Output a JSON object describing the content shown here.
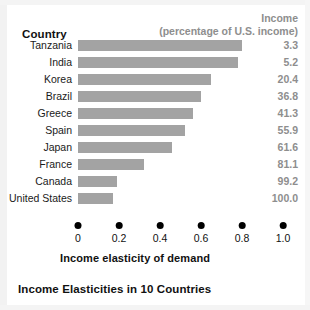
{
  "header": {
    "country_label": "Country",
    "income_line1": "Income",
    "income_line2": "(percentage of U.S. income)"
  },
  "caption": "Income Elasticities in 10 Countries",
  "axis": {
    "title": "Income elasticity of demand",
    "ticks": [
      "0",
      "0.2",
      "0.4",
      "0.6",
      "0.8",
      "1.0"
    ]
  },
  "colors": {
    "bar": "#a3a3a3",
    "value_text": "#8e8e8e",
    "label_text": "#1a1a1a",
    "axis_dot": "#000000",
    "background": "#ffffff"
  },
  "chart_data": {
    "type": "bar",
    "orientation": "horizontal",
    "title": "Income Elasticities in 10 Countries",
    "xlabel": "Income elasticity of demand",
    "ylabel": "Country",
    "xlim": [
      0,
      1.0
    ],
    "xticks": [
      0,
      0.2,
      0.4,
      0.6,
      0.8,
      1.0
    ],
    "grid": false,
    "legend": "none",
    "categories": [
      "Tanzania",
      "India",
      "Korea",
      "Brazil",
      "Greece",
      "Spain",
      "Japan",
      "France",
      "Canada",
      "United States"
    ],
    "values": [
      0.8,
      0.78,
      0.65,
      0.6,
      0.56,
      0.52,
      0.46,
      0.32,
      0.19,
      0.17
    ],
    "series": [
      {
        "name": "Income elasticity of demand",
        "values": [
          0.8,
          0.78,
          0.65,
          0.6,
          0.56,
          0.52,
          0.46,
          0.32,
          0.19,
          0.17
        ]
      }
    ],
    "annotation_column": {
      "header": "Income (percentage of U.S. income)",
      "values": [
        "3.3",
        "5.2",
        "20.4",
        "36.8",
        "41.3",
        "55.9",
        "61.6",
        "81.1",
        "99.2",
        "100.0"
      ]
    },
    "rows": [
      {
        "country": "Tanzania",
        "elasticity": 0.8,
        "income": "3.3"
      },
      {
        "country": "India",
        "elasticity": 0.78,
        "income": "5.2"
      },
      {
        "country": "Korea",
        "elasticity": 0.65,
        "income": "20.4"
      },
      {
        "country": "Brazil",
        "elasticity": 0.6,
        "income": "36.8"
      },
      {
        "country": "Greece",
        "elasticity": 0.56,
        "income": "41.3"
      },
      {
        "country": "Spain",
        "elasticity": 0.52,
        "income": "55.9"
      },
      {
        "country": "Japan",
        "elasticity": 0.46,
        "income": "61.6"
      },
      {
        "country": "France",
        "elasticity": 0.32,
        "income": "81.1"
      },
      {
        "country": "Canada",
        "elasticity": 0.19,
        "income": "99.2"
      },
      {
        "country": "United States",
        "elasticity": 0.17,
        "income": "100.0"
      }
    ]
  }
}
